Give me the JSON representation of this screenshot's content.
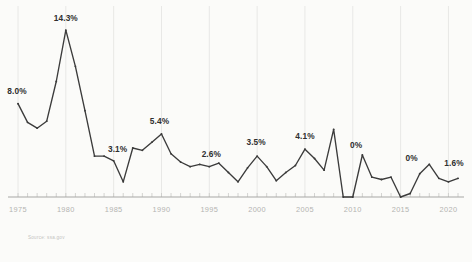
{
  "source_note": "Source: ssa.gov",
  "chart_data": {
    "type": "line",
    "title": "",
    "subtitle": "",
    "xlabel": "",
    "ylabel": "",
    "grid": "vertical-only",
    "legend": "none",
    "xlim": [
      1975,
      2021
    ],
    "ylim": [
      0,
      15
    ],
    "x_tick_labels": [
      "1975",
      "1980",
      "1985",
      "1990",
      "1995",
      "2000",
      "2005",
      "2010",
      "2015",
      "2020"
    ],
    "x_tick_values": [
      1975,
      1980,
      1985,
      1990,
      1995,
      2000,
      2005,
      2010,
      2015,
      2020
    ],
    "series": [
      {
        "name": "Social Security COLA",
        "color": "#3b3b3b",
        "x": [
          1975,
          1976,
          1977,
          1978,
          1979,
          1980,
          1981,
          1982,
          1983,
          1984,
          1985,
          1986,
          1987,
          1988,
          1989,
          1990,
          1991,
          1992,
          1993,
          1994,
          1995,
          1996,
          1997,
          1998,
          1999,
          2000,
          2001,
          2002,
          2003,
          2004,
          2005,
          2006,
          2007,
          2008,
          2009,
          2010,
          2011,
          2012,
          2013,
          2014,
          2015,
          2016,
          2017,
          2018,
          2019,
          2020,
          2021
        ],
        "values": [
          8.0,
          6.4,
          5.9,
          6.5,
          9.9,
          14.3,
          11.2,
          7.4,
          3.5,
          3.5,
          3.1,
          1.3,
          4.2,
          4.0,
          4.7,
          5.4,
          3.7,
          3.0,
          2.6,
          2.8,
          2.6,
          2.9,
          2.1,
          1.3,
          2.5,
          3.5,
          2.6,
          1.4,
          2.1,
          2.7,
          4.1,
          3.3,
          2.3,
          5.8,
          0.0,
          0.0,
          3.6,
          1.7,
          1.5,
          1.7,
          0.0,
          0.3,
          2.0,
          2.8,
          1.6,
          1.3,
          1.6
        ]
      }
    ],
    "point_labels": [
      {
        "x": 1975,
        "text": "8.0%"
      },
      {
        "x": 1980,
        "text": "14.3%"
      },
      {
        "x": 1985,
        "text": "3.1%"
      },
      {
        "x": 1990,
        "text": "5.4%"
      },
      {
        "x": 1995,
        "text": "2.6%"
      },
      {
        "x": 2000,
        "text": "3.5%"
      },
      {
        "x": 2005,
        "text": "4.1%"
      },
      {
        "x": 2009,
        "text": "0%"
      },
      {
        "x": 2015,
        "text": "0%"
      },
      {
        "x": 2021,
        "text": "1.6%"
      }
    ]
  }
}
